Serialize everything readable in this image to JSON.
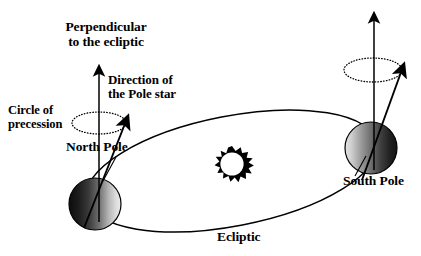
{
  "figure": {
    "background_color": "#ffffff",
    "ink_color": "#000000"
  },
  "labels": {
    "perpendicular_line1": "Perpendicular",
    "perpendicular_line2": "to the ecliptic",
    "direction_line1": "Direction of",
    "direction_line2": "the Pole star",
    "circle_line1": "Circle of",
    "circle_line2": "precession",
    "north_pole": "North Pole",
    "south_pole": "South Pole",
    "ecliptic": "Ecliptic"
  },
  "objects": {
    "sun": {
      "name": "sun-symbol",
      "center_x": 232,
      "center_y": 164,
      "outer_radius": 18,
      "inner_radius": 12,
      "spikes": 16,
      "fill": "#000000",
      "core_fill": "#ffffff"
    },
    "earth_left": {
      "name": "earth-north-summer",
      "center_x": 95,
      "center_y": 204,
      "radius": 26,
      "shading": "dark-left-light-right",
      "dark": "#1a1a1a",
      "light": "#e8e8e8"
    },
    "earth_right": {
      "name": "earth-south-summer",
      "center_x": 371,
      "center_y": 148,
      "radius": 26,
      "shading": "light-left-dark-right",
      "dark": "#1a1a1a",
      "light": "#e8e8e8"
    },
    "ecliptic_orbit": {
      "name": "ecliptic-ellipse",
      "center_x": 232,
      "center_y": 171,
      "rx": 148,
      "ry": 55,
      "rotation_deg": -11,
      "stroke": "#000000",
      "stroke_width": 1.4,
      "fill": "none"
    },
    "precession_circle_left": {
      "name": "precession-ellipse-left",
      "center_x": 99,
      "center_y": 123,
      "rx": 27,
      "ry": 11,
      "style": "dotted"
    },
    "precession_circle_right": {
      "name": "precession-ellipse-right",
      "center_x": 373,
      "center_y": 70,
      "rx": 29,
      "ry": 12,
      "style": "dotted"
    },
    "perpendicular_arrow_left": {
      "name": "perpendicular-arrow-left",
      "x1": 99,
      "y1": 218,
      "x2": 99,
      "y2": 62
    },
    "pole_star_arrow_left": {
      "name": "pole-star-arrow-left",
      "x1": 84,
      "y1": 226,
      "x2": 130,
      "y2": 112
    },
    "perpendicular_arrow_right": {
      "name": "perpendicular-arrow-right",
      "x1": 374,
      "y1": 166,
      "x2": 374,
      "y2": 9
    },
    "pole_star_arrow_right": {
      "name": "pole-star-arrow-right",
      "x1": 362,
      "y1": 178,
      "x2": 406,
      "y2": 60
    },
    "leader_north_pole": {
      "name": "leader-line-north-pole",
      "x1": 115,
      "y1": 158,
      "x2": 104,
      "y2": 180
    },
    "leader_south_pole": {
      "name": "leader-line-south-pole",
      "x1": 356,
      "y1": 175,
      "x2": 366,
      "y2": 155
    }
  }
}
